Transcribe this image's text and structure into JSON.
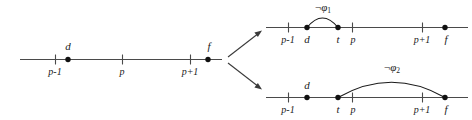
{
  "figure": {
    "caption": "",
    "background_color": "#ffffff",
    "line_color": "#4a4a4a",
    "dot_color": "#111111",
    "arc_color": "#1a1a1a",
    "timelines": [
      {
        "id": "timeline-left",
        "name": "original-interval",
        "ticks": [
          {
            "label": "p-1",
            "x": 55
          },
          {
            "label": "p",
            "x": 122
          },
          {
            "label": "p+1",
            "x": 190
          }
        ],
        "points": [
          {
            "label": "d",
            "x": 68
          },
          {
            "label": "f",
            "x": 208
          }
        ],
        "arcs": []
      },
      {
        "id": "timeline-top-right",
        "name": "case-one-interval",
        "ticks": [
          {
            "label": "p-1",
            "x": 288
          },
          {
            "label": "p",
            "x": 352
          },
          {
            "label": "p+1",
            "x": 422
          }
        ],
        "points": [
          {
            "label": "d",
            "x": 307
          },
          {
            "label": "t",
            "x": 338
          },
          {
            "label": "f",
            "x": 445
          }
        ],
        "arcs": [
          {
            "label_neg": "¬",
            "label_symbol": "φ",
            "label_sub": "1",
            "from_x": 307,
            "to_x": 338,
            "height": 12
          }
        ]
      },
      {
        "id": "timeline-bottom-right",
        "name": "case-two-interval",
        "ticks": [
          {
            "label": "p-1",
            "x": 288
          },
          {
            "label": "p",
            "x": 352
          },
          {
            "label": "p+1",
            "x": 422
          }
        ],
        "points": [
          {
            "label": "d",
            "x": 307
          },
          {
            "label": "t",
            "x": 338
          },
          {
            "label": "f",
            "x": 445
          }
        ],
        "arcs": [
          {
            "label_neg": "¬",
            "label_symbol": "φ",
            "label_sub": "2",
            "from_x": 338,
            "to_x": 445,
            "height": 19
          }
        ]
      }
    ],
    "branches": [
      {
        "name": "branch-arrow-up",
        "from_x": 228,
        "from_y": 57,
        "to_x": 262,
        "to_y": 31
      },
      {
        "name": "branch-arrow-down",
        "from_x": 228,
        "from_y": 63,
        "to_x": 262,
        "to_y": 89
      }
    ],
    "labels": {
      "left": {
        "tick_p_minus_1": "p-1",
        "tick_p": "p",
        "tick_p_plus_1": "p+1",
        "point_d": "d",
        "point_f": "f"
      },
      "top_right": {
        "tick_p_minus_1": "p-1",
        "tick_p": "p",
        "tick_p_plus_1": "p+1",
        "point_d": "d",
        "point_t": "t",
        "point_f": "f",
        "arc_neg": "¬",
        "arc_symbol": "φ",
        "arc_sub": "1"
      },
      "bottom_right": {
        "tick_p_minus_1": "p-1",
        "tick_p": "p",
        "tick_p_plus_1": "p+1",
        "point_d": "d",
        "point_t": "t",
        "point_f": "f",
        "arc_neg": "¬",
        "arc_symbol": "φ",
        "arc_sub": "2"
      }
    }
  }
}
